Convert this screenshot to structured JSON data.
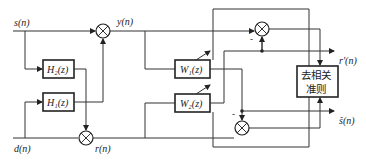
{
  "diagram": {
    "type": "block-diagram",
    "signals": {
      "s": "s(n)",
      "d": "d(n)",
      "y": "y(n)",
      "r": "r(n)",
      "r_prime": "r′(n)",
      "s_hat": "ŝ(n)"
    },
    "blocks": {
      "h2": "H₂(z)",
      "h1": "H₁(z)",
      "w1": "W₁(z)",
      "w2": "W₂(z)",
      "decorrelation_line1": "去相关",
      "decorrelation_line2": "准则"
    },
    "summing_junctions": [
      {
        "id": "sum-y",
        "output": "y(n)"
      },
      {
        "id": "sum-r",
        "output": "r(n)"
      },
      {
        "id": "sum-r-prime",
        "output": "r′(n)",
        "sign": "-"
      },
      {
        "id": "sum-s-hat",
        "output": "ŝ(n)",
        "sign": "-"
      }
    ],
    "signs": {
      "minus_upper": "-",
      "minus_lower": "-"
    }
  }
}
